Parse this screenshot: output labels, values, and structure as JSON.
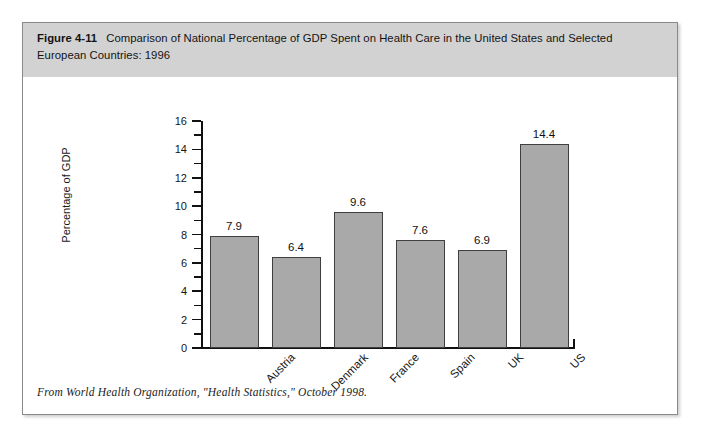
{
  "figure": {
    "number": "Figure 4-11",
    "caption": "Comparison of National Percentage of GDP Spent on Health Care in the United States and Selected European Countries: 1996",
    "source_note": "From World Health Organization, \"Health Statistics,\" October 1998."
  },
  "colors": {
    "header_band": "#d2d2d2",
    "bar_fill": "#a9a9a9",
    "bar_border": "#3f3f3f",
    "axis": "#111111",
    "frame_border": "#8a8a8a",
    "page_background": "#ffffff"
  },
  "chart_data": {
    "type": "bar",
    "title": "Comparison of National Percentage of GDP Spent on Health Care in the United States and Selected European Countries: 1996",
    "categories": [
      "Austria",
      "Denmark",
      "France",
      "Spain",
      "UK",
      "US"
    ],
    "values": [
      7.9,
      6.4,
      9.6,
      7.6,
      6.9,
      14.4
    ],
    "value_labels": [
      "7.9",
      "6.4",
      "9.6",
      "7.6",
      "6.9",
      "14.4"
    ],
    "xlabel": "",
    "ylabel": "Percentage of GDP",
    "ylim": [
      0,
      16
    ],
    "ytick_major": [
      0,
      2,
      4,
      6,
      8,
      10,
      12,
      14,
      16
    ],
    "ytick_major_labels": [
      "0",
      "2",
      "4",
      "6",
      "8",
      "10",
      "12",
      "14",
      "16"
    ],
    "ytick_minor": [
      1,
      3,
      5,
      7,
      9,
      11,
      13,
      15
    ],
    "grid": false,
    "legend": "none",
    "xtick_label_rotation": -45,
    "bar_count": 6
  }
}
